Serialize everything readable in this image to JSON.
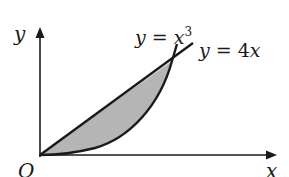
{
  "diagram": {
    "type": "area-between-curves",
    "axes": {
      "x_label": "x",
      "y_label": "y",
      "origin_label": "O"
    },
    "curves": [
      {
        "name": "cubic",
        "label_lhs": "y = ",
        "label_var": "x",
        "label_exp": "3",
        "equation": "y = x^3"
      },
      {
        "name": "line",
        "label_lhs": "y = ",
        "label_rhs": "4x",
        "equation": "y = 4x"
      }
    ],
    "shaded_region": {
      "between": [
        "y = 4x",
        "y = x^3"
      ],
      "fill": "#b5b5b5"
    },
    "colors": {
      "stroke": "#1a1a1a",
      "fill": "#b5b5b5",
      "background": "#ffffff"
    }
  }
}
